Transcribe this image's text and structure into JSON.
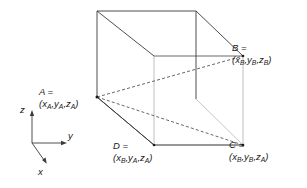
{
  "figure": {
    "type": "3d-cube-diagram",
    "background_color": "#ffffff",
    "line_color_front": "#3a3a3a",
    "line_color_back": "#b0b0b0",
    "line_color_dashed": "#5a5a5a",
    "text_color": "#1a1a1a"
  },
  "vertices": {
    "A": {
      "name": "A",
      "equals": "A =",
      "coords": "(x",
      "sub1": "A",
      "sep1": ",y",
      "sub2": "A",
      "sep2": ",z",
      "sub3": "A",
      "close": ")",
      "full": "(xA,yA,zA)"
    },
    "B": {
      "name": "B",
      "equals": "B =",
      "coords": "(x",
      "sub1": "B",
      "sep1": ",y",
      "sub2": "B",
      "sep2": ",z",
      "sub3": "B",
      "close": ")",
      "full": "(xB,yB,zB)"
    },
    "C": {
      "name": "C",
      "equals": "C =",
      "coords": "(x",
      "sub1": "B",
      "sep1": ",y",
      "sub2": "B",
      "sep2": ",z",
      "sub3": "A",
      "close": ")",
      "full": "(xB,yB,zA)"
    },
    "D": {
      "name": "D",
      "equals": "D =",
      "coords": "(x",
      "sub1": "B",
      "sep1": ",y",
      "sub2": "A",
      "sep2": ",z",
      "sub3": "A",
      "close": ")",
      "full": "(xB,yA,zA)"
    }
  },
  "axes": {
    "z_label": "z",
    "y_label": "y",
    "x_label": "x"
  }
}
